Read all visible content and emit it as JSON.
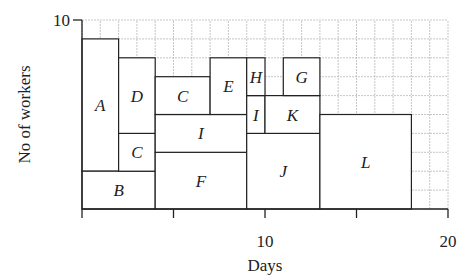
{
  "chart_data": {
    "type": "gantt-resource-histogram",
    "title": "",
    "xlabel": "Days",
    "ylabel": "No of workers",
    "xlim": [
      0,
      20
    ],
    "ylim": [
      0,
      10
    ],
    "x_ticks": [
      0,
      5,
      10,
      15,
      20
    ],
    "x_tick_labels": [
      "",
      "",
      "10",
      "",
      "20"
    ],
    "y_ticks": [
      10
    ],
    "y_tick_labels": [
      "10"
    ],
    "grid": true,
    "grid_step": 1,
    "blocks": [
      {
        "label": "A",
        "x0": 0,
        "x1": 2,
        "y0": 2,
        "y1": 9
      },
      {
        "label": "B",
        "x0": 0,
        "x1": 4,
        "y0": 0,
        "y1": 2
      },
      {
        "label": "C",
        "x0": 2,
        "x1": 4,
        "y0": 2,
        "y1": 4
      },
      {
        "label": "D",
        "x0": 2,
        "x1": 4,
        "y0": 4,
        "y1": 8
      },
      {
        "label": "F",
        "x0": 4,
        "x1": 9,
        "y0": 0,
        "y1": 3
      },
      {
        "label": "I",
        "x0": 4,
        "x1": 9,
        "y0": 3,
        "y1": 5
      },
      {
        "label": "C",
        "x0": 4,
        "x1": 7,
        "y0": 5,
        "y1": 7
      },
      {
        "label": "E",
        "x0": 7,
        "x1": 9,
        "y0": 5,
        "y1": 8
      },
      {
        "label": "J",
        "x0": 9,
        "x1": 13,
        "y0": 0,
        "y1": 4
      },
      {
        "label": "I",
        "x0": 9,
        "x1": 10,
        "y0": 4,
        "y1": 6
      },
      {
        "label": "H",
        "x0": 9,
        "x1": 10,
        "y0": 6,
        "y1": 8
      },
      {
        "label": "K",
        "x0": 10,
        "x1": 13,
        "y0": 4,
        "y1": 6
      },
      {
        "label": "G",
        "x0": 11,
        "x1": 13,
        "y0": 6,
        "y1": 8
      },
      {
        "label": "L",
        "x0": 13,
        "x1": 18,
        "y0": 0,
        "y1": 5
      }
    ]
  },
  "colors": {
    "grid": "#b8b8b8",
    "block_stroke": "#222222",
    "axis": "#222222",
    "text": "#222222"
  }
}
